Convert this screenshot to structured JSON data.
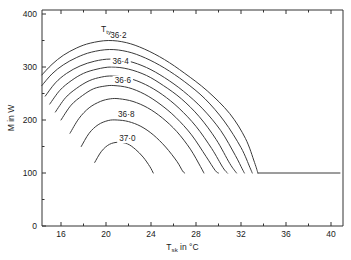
{
  "chart_data": {
    "type": "line",
    "title": "",
    "xlabel": "T_sk in °C",
    "ylabel": "M in W",
    "xlabel_main": "T",
    "xlabel_sub": "sk",
    "xlabel_tail": " in °C",
    "ylabel_text": "M in W",
    "xlim": [
      14.3,
      40.8
    ],
    "ylim": [
      0,
      420
    ],
    "xticks": [
      16,
      20,
      24,
      28,
      32,
      36,
      40
    ],
    "xticklabels": [
      "16",
      "20",
      "24",
      "28",
      "32",
      "36",
      "40"
    ],
    "xminorticks": [
      18,
      22,
      26,
      30,
      34,
      38
    ],
    "yticks": [
      0,
      100,
      200,
      300,
      400
    ],
    "yticklabels": [
      "0",
      "100",
      "200",
      "300",
      "400"
    ],
    "yminorticks": [
      50,
      150,
      250,
      350
    ],
    "grid": false,
    "legend_position": "inside-upper-left",
    "legend_title": "T",
    "legend_title_sub": "ty",
    "plateau_value": 100,
    "plateau_start_x": 33.5,
    "plateau_end_x": 40.8,
    "series": [
      {
        "name": "36.1",
        "label": "",
        "labeled": false,
        "peak_x": 20.2,
        "peak_y": 350,
        "left_x": 14.3,
        "left_y": 285,
        "right_x": 33.5,
        "right_y": 100,
        "points": [
          [
            14.3,
            285
          ],
          [
            15.2,
            305
          ],
          [
            16.2,
            322
          ],
          [
            17.4,
            336
          ],
          [
            18.6,
            345
          ],
          [
            20.2,
            350
          ],
          [
            21.8,
            346
          ],
          [
            23.4,
            334
          ],
          [
            25.2,
            314
          ],
          [
            27.0,
            288
          ],
          [
            29.0,
            255
          ],
          [
            31.0,
            212
          ],
          [
            32.4,
            165
          ],
          [
            33.2,
            120
          ],
          [
            33.5,
            100
          ]
        ]
      },
      {
        "name": "36.2",
        "label": "36·2",
        "labeled": true,
        "peak_x": 20.3,
        "peak_y": 333,
        "left_x": 14.3,
        "left_y": 265,
        "right_x": 33.0,
        "right_y": 100,
        "points": [
          [
            14.3,
            265
          ],
          [
            15.2,
            287
          ],
          [
            16.2,
            304
          ],
          [
            17.4,
            318
          ],
          [
            18.7,
            328
          ],
          [
            20.3,
            333
          ],
          [
            21.9,
            329
          ],
          [
            23.5,
            317
          ],
          [
            25.2,
            298
          ],
          [
            27.0,
            272
          ],
          [
            28.8,
            240
          ],
          [
            30.5,
            198
          ],
          [
            32.0,
            148
          ],
          [
            32.8,
            110
          ],
          [
            33.0,
            100
          ]
        ]
      },
      {
        "name": "36.3",
        "label": "",
        "labeled": false,
        "peak_x": 20.4,
        "peak_y": 315,
        "left_x": 14.6,
        "left_y": 245,
        "right_x": 32.3,
        "right_y": 100,
        "points": [
          [
            14.6,
            245
          ],
          [
            15.5,
            270
          ],
          [
            16.5,
            288
          ],
          [
            17.7,
            302
          ],
          [
            19.0,
            311
          ],
          [
            20.4,
            315
          ],
          [
            22.0,
            311
          ],
          [
            23.6,
            299
          ],
          [
            25.2,
            280
          ],
          [
            26.9,
            254
          ],
          [
            28.6,
            221
          ],
          [
            30.2,
            180
          ],
          [
            31.5,
            133
          ],
          [
            32.1,
            108
          ],
          [
            32.3,
            100
          ]
        ]
      },
      {
        "name": "36.4",
        "label": "36·4",
        "labeled": true,
        "peak_x": 20.5,
        "peak_y": 300,
        "left_x": 15.0,
        "left_y": 230,
        "right_x": 31.6,
        "right_y": 100,
        "points": [
          [
            15.0,
            230
          ],
          [
            15.9,
            256
          ],
          [
            16.9,
            274
          ],
          [
            18.0,
            288
          ],
          [
            19.2,
            296
          ],
          [
            20.5,
            300
          ],
          [
            22.0,
            296
          ],
          [
            23.6,
            284
          ],
          [
            25.1,
            265
          ],
          [
            26.7,
            240
          ],
          [
            28.3,
            206
          ],
          [
            29.8,
            163
          ],
          [
            31.0,
            118
          ],
          [
            31.6,
            100
          ]
        ]
      },
      {
        "name": "36.5",
        "label": "",
        "labeled": false,
        "peak_x": 20.6,
        "peak_y": 283,
        "left_x": 15.5,
        "left_y": 215,
        "right_x": 30.8,
        "right_y": 100,
        "points": [
          [
            15.5,
            215
          ],
          [
            16.4,
            242
          ],
          [
            17.4,
            260
          ],
          [
            18.5,
            274
          ],
          [
            19.6,
            281
          ],
          [
            20.6,
            283
          ],
          [
            22.0,
            279
          ],
          [
            23.5,
            267
          ],
          [
            25.0,
            248
          ],
          [
            26.5,
            222
          ],
          [
            28.0,
            188
          ],
          [
            29.4,
            146
          ],
          [
            30.4,
            110
          ],
          [
            30.8,
            100
          ]
        ]
      },
      {
        "name": "36.6",
        "label": "36·6",
        "labeled": true,
        "peak_x": 20.7,
        "peak_y": 265,
        "left_x": 16.0,
        "left_y": 200,
        "right_x": 30.0,
        "right_y": 100,
        "points": [
          [
            16.0,
            200
          ],
          [
            16.9,
            228
          ],
          [
            17.9,
            246
          ],
          [
            18.9,
            259
          ],
          [
            19.9,
            264
          ],
          [
            20.7,
            265
          ],
          [
            22.0,
            261
          ],
          [
            23.4,
            249
          ],
          [
            24.8,
            230
          ],
          [
            26.2,
            205
          ],
          [
            27.6,
            172
          ],
          [
            28.9,
            131
          ],
          [
            29.7,
            105
          ],
          [
            30.0,
            100
          ]
        ]
      },
      {
        "name": "36.7",
        "label": "",
        "labeled": false,
        "peak_x": 21.0,
        "peak_y": 240,
        "left_x": 16.8,
        "left_y": 175,
        "right_x": 28.7,
        "right_y": 100,
        "points": [
          [
            16.8,
            175
          ],
          [
            17.6,
            203
          ],
          [
            18.5,
            223
          ],
          [
            19.5,
            235
          ],
          [
            20.4,
            240
          ],
          [
            21.2,
            240
          ],
          [
            22.4,
            235
          ],
          [
            23.7,
            223
          ],
          [
            25.0,
            204
          ],
          [
            26.3,
            178
          ],
          [
            27.5,
            145
          ],
          [
            28.4,
            112
          ],
          [
            28.7,
            100
          ]
        ]
      },
      {
        "name": "36.8",
        "label": "36·8",
        "labeled": true,
        "peak_x": 21.0,
        "peak_y": 200,
        "left_x": 17.8,
        "left_y": 150,
        "right_x": 27.0,
        "right_y": 100,
        "points": [
          [
            17.8,
            150
          ],
          [
            18.5,
            175
          ],
          [
            19.3,
            191
          ],
          [
            20.2,
            199
          ],
          [
            21.0,
            200
          ],
          [
            22.0,
            197
          ],
          [
            23.1,
            188
          ],
          [
            24.2,
            172
          ],
          [
            25.3,
            149
          ],
          [
            26.3,
            122
          ],
          [
            26.8,
            104
          ],
          [
            27.0,
            100
          ]
        ]
      },
      {
        "name": "37.0",
        "label": "37·0",
        "labeled": true,
        "peak_x": 21.1,
        "peak_y": 158,
        "left_x": 19.0,
        "left_y": 120,
        "right_x": 24.2,
        "right_y": 100,
        "points": [
          [
            19.0,
            120
          ],
          [
            19.6,
            141
          ],
          [
            20.3,
            154
          ],
          [
            21.1,
            158
          ],
          [
            21.9,
            155
          ],
          [
            22.6,
            145
          ],
          [
            23.3,
            130
          ],
          [
            23.9,
            112
          ],
          [
            24.2,
            100
          ]
        ]
      }
    ],
    "curve_label_positions": [
      {
        "label": "36·2",
        "x": 21.1,
        "y": 357
      },
      {
        "label": "36·4",
        "x": 21.3,
        "y": 307
      },
      {
        "label": "36·6",
        "x": 21.5,
        "y": 272
      },
      {
        "label": "36·8",
        "x": 21.8,
        "y": 208
      },
      {
        "label": "37·0",
        "x": 21.9,
        "y": 162
      }
    ]
  }
}
